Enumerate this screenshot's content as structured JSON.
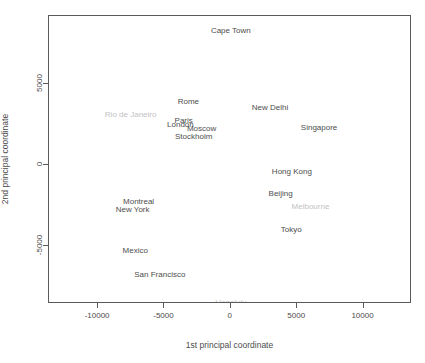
{
  "chart_data": {
    "type": "scatter",
    "title": "",
    "xlabel": "1st principal coordinate",
    "ylabel": "2nd principal coordinate",
    "xlim": [
      -13700,
      13650
    ],
    "ylim": [
      -8550,
      9150
    ],
    "xticks": [
      "-10000",
      "-5000",
      "0",
      "5000",
      "10000"
    ],
    "xtickvalues": [
      -10000,
      -5000,
      0,
      5000,
      10000
    ],
    "yticks": [
      "5000",
      "0",
      "-5000"
    ],
    "ytickvalues": [
      5000,
      0,
      -5000
    ],
    "grid": false,
    "legend": false,
    "marker": "text-label",
    "points": [
      {
        "label": "Cape Town",
        "x": 0,
        "y": 8300,
        "faded": false
      },
      {
        "label": "Rome",
        "x": -3200,
        "y": 3950,
        "faded": false
      },
      {
        "label": "New Delhi",
        "x": 2950,
        "y": 3550,
        "faded": false
      },
      {
        "label": "Rio de Janeiro",
        "x": -7550,
        "y": 3150,
        "faded": true
      },
      {
        "label": "Paris",
        "x": -3550,
        "y": 2750,
        "faded": false
      },
      {
        "label": "London",
        "x": -3800,
        "y": 2500,
        "faded": false
      },
      {
        "label": "Singapore",
        "x": 6650,
        "y": 2350,
        "faded": false
      },
      {
        "label": "Moscow",
        "x": -2200,
        "y": 2250,
        "faded": false
      },
      {
        "label": "Stockholm",
        "x": -2800,
        "y": 1800,
        "faded": false
      },
      {
        "label": "Hong Kong",
        "x": 4600,
        "y": -400,
        "faded": false
      },
      {
        "label": "Beijing",
        "x": 3750,
        "y": -1700,
        "faded": false
      },
      {
        "label": "Montreal",
        "x": -6950,
        "y": -2250,
        "faded": false
      },
      {
        "label": "Melbourne",
        "x": 6000,
        "y": -2550,
        "faded": true
      },
      {
        "label": "New York",
        "x": -7400,
        "y": -2700,
        "faded": false
      },
      {
        "label": "Tokyo",
        "x": 4550,
        "y": -3950,
        "faded": false
      },
      {
        "label": "Mexico",
        "x": -7200,
        "y": -5250,
        "faded": false
      },
      {
        "label": "San Francisco",
        "x": -5350,
        "y": -6700,
        "faded": false
      },
      {
        "label": "Honolulu",
        "x": 10,
        "y": -8400,
        "faded": true
      }
    ]
  }
}
